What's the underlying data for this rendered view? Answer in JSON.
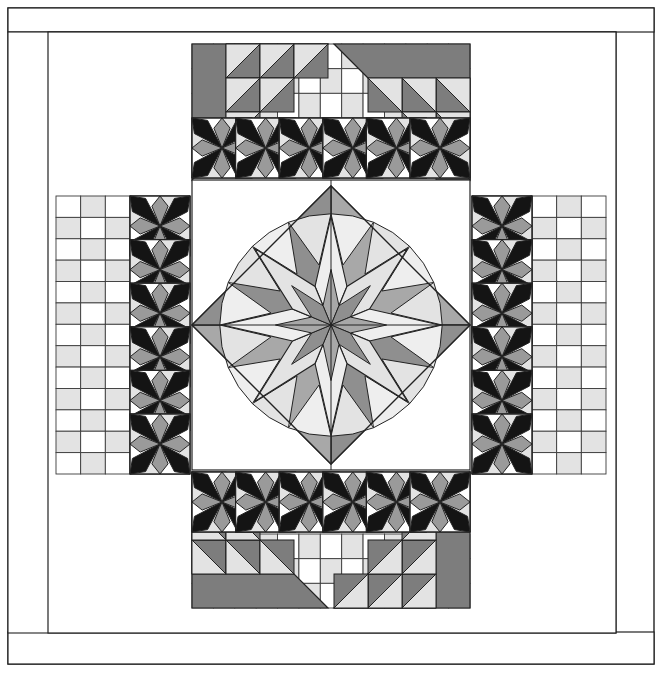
{
  "document": {
    "title": "Quilt Block Pattern Diagram",
    "type": "line-art-quilt-schematic",
    "canvas": {
      "width": 662,
      "height": 684,
      "background": "#ffffff"
    }
  },
  "palette": {
    "white": "#ffffff",
    "light_gray": "#e3e3e3",
    "pale_gray": "#eeeeee",
    "mid_gray": "#a8a8a8",
    "medium_gray": "#9a9a9a",
    "dark_gray": "#7d7d7d",
    "deep_gray": "#8f8f8f",
    "near_black": "#1d1d1d",
    "black": "#141414",
    "outline": "#222222",
    "thin_outline": "#3a3a3a"
  },
  "layout": {
    "outer_border": {
      "x": 8,
      "y": 8,
      "width": 646,
      "height": 656,
      "label": "outer binding frame"
    },
    "top_band": {
      "x": 8,
      "y": 8,
      "width": 646,
      "height": 24,
      "label": "top plain sashing"
    },
    "bottom_band": {
      "x": 8,
      "y": 632,
      "width": 646,
      "height": 32,
      "label": "bottom plain sashing"
    },
    "inner_frame": {
      "x": 8,
      "y": 32,
      "width": 608,
      "height": 601,
      "label": "quilt body frame"
    },
    "quilt_body": {
      "x": 48,
      "y": 32,
      "width": 568,
      "height": 601
    },
    "center_square": {
      "x": 192,
      "y": 180,
      "width": 278,
      "height": 290,
      "label": "center medallion field"
    },
    "star_band_thickness": 60,
    "grid_cell": 22
  },
  "chart_data": {
    "type": "diagram",
    "components": [
      {
        "name": "center-lemoyne-star",
        "count": 1,
        "points": 8,
        "note": "star on point within diamond, graded gray wedges"
      },
      {
        "name": "pinwheel-star-block",
        "count": 24,
        "note": "black and gray eight-point star blocks forming four sashing bands"
      },
      {
        "name": "corner-triangle-unit",
        "count": 4,
        "note": "large half-square triangle with stepped half-square-triangle staircase"
      },
      {
        "name": "checkerboard-panel",
        "count": 8,
        "note": "alternating white and light gray grid squares"
      },
      {
        "name": "plain-border-band",
        "count": 2,
        "note": "top and bottom plain sashing strips"
      }
    ],
    "symmetry": "4-fold rotational / bilateral",
    "star_band_counts": {
      "top": 6,
      "bottom": 6,
      "left": 6,
      "right": 6
    }
  },
  "legend": {
    "shades": [
      {
        "name": "white",
        "hex": "#ffffff"
      },
      {
        "name": "pale gray",
        "hex": "#eeeeee"
      },
      {
        "name": "light gray",
        "hex": "#e3e3e3"
      },
      {
        "name": "medium gray",
        "hex": "#9a9a9a"
      },
      {
        "name": "dark gray",
        "hex": "#7d7d7d"
      },
      {
        "name": "black",
        "hex": "#141414"
      }
    ]
  }
}
